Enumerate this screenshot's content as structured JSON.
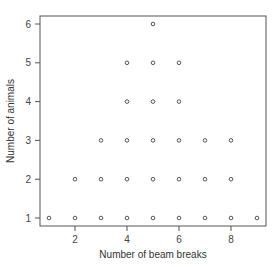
{
  "chart_data": {
    "type": "scatter",
    "title": "",
    "xlabel": "Number of beam breaks",
    "ylabel": "Number of animals",
    "xlim": [
      0.6,
      9.4
    ],
    "ylim": [
      0.75,
      6.25
    ],
    "xticks": [
      2,
      4,
      6,
      8
    ],
    "yticks": [
      1,
      2,
      3,
      4,
      5,
      6
    ],
    "grid": false,
    "legend": null,
    "marker": "open-circle",
    "series": [
      {
        "name": "observations",
        "points": [
          [
            1,
            1
          ],
          [
            2,
            1
          ],
          [
            2,
            2
          ],
          [
            3,
            1
          ],
          [
            3,
            2
          ],
          [
            3,
            3
          ],
          [
            4,
            1
          ],
          [
            4,
            2
          ],
          [
            4,
            3
          ],
          [
            4,
            4
          ],
          [
            4,
            5
          ],
          [
            5,
            1
          ],
          [
            5,
            2
          ],
          [
            5,
            3
          ],
          [
            5,
            4
          ],
          [
            5,
            5
          ],
          [
            5,
            6
          ],
          [
            6,
            1
          ],
          [
            6,
            2
          ],
          [
            6,
            3
          ],
          [
            6,
            4
          ],
          [
            6,
            5
          ],
          [
            7,
            1
          ],
          [
            7,
            2
          ],
          [
            7,
            3
          ],
          [
            8,
            1
          ],
          [
            8,
            2
          ],
          [
            8,
            3
          ],
          [
            9,
            1
          ]
        ]
      }
    ]
  },
  "colors": {
    "frame": "#555555",
    "marker": "#444444",
    "text": "#444444"
  }
}
